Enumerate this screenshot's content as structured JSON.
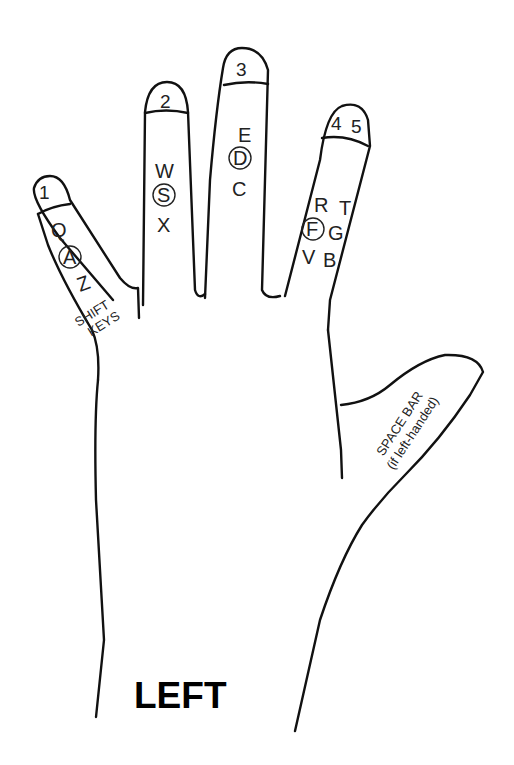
{
  "title": "LEFT",
  "fingers": [
    {
      "id": "pinky",
      "number": "1",
      "keys": {
        "top": "Q",
        "home": "A",
        "bottom": "Z"
      },
      "extra": [
        "SHIFT",
        "KEYS"
      ]
    },
    {
      "id": "ring",
      "number": "2",
      "keys": {
        "top": "W",
        "home": "S",
        "bottom": "X"
      }
    },
    {
      "id": "middle",
      "number": "3",
      "keys": {
        "top": "E",
        "home": "D",
        "bottom": "C"
      }
    },
    {
      "id": "index",
      "number_a": "4",
      "number_b": "5",
      "keys": {
        "top": "R",
        "top2": "T",
        "home": "F",
        "home2": "G",
        "bottom": "V",
        "bottom2": "B"
      }
    }
  ],
  "thumb": {
    "line1": "SPACE BAR",
    "line2": "(if left-handed)"
  },
  "colors": {
    "stroke": "#111111",
    "background": "#ffffff"
  }
}
